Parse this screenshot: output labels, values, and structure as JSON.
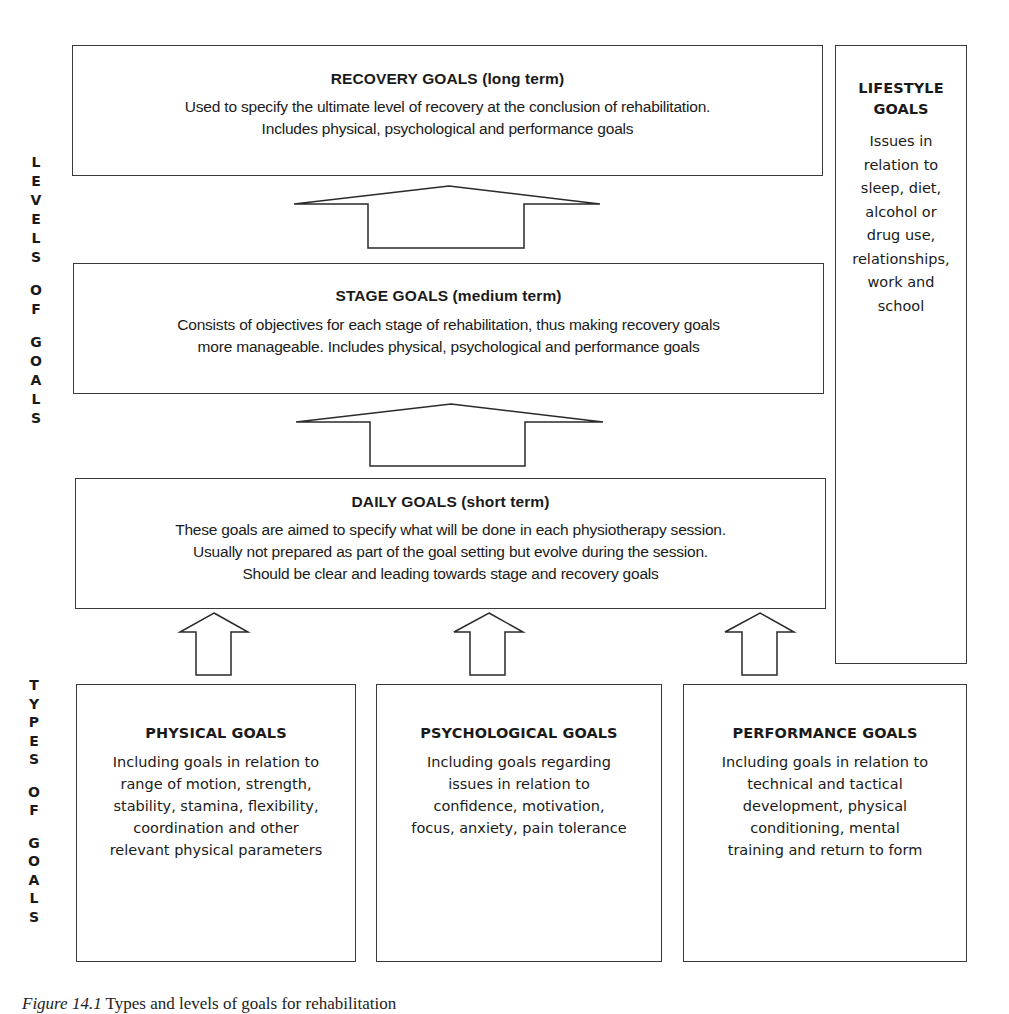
{
  "diagram": {
    "levels_label": [
      "L",
      "E",
      "V",
      "E",
      "L",
      "S",
      "",
      "O",
      "F",
      "",
      "G",
      "O",
      "A",
      "L",
      "S"
    ],
    "types_label": [
      "T",
      "Y",
      "P",
      "E",
      "S",
      "",
      "O",
      "F",
      "",
      "G",
      "O",
      "A",
      "L",
      "S"
    ],
    "levels": {
      "recovery": {
        "title": "RECOVERY GOALS (long term)",
        "lines": [
          "Used to specify the ultimate level of recovery at the conclusion of rehabilitation.",
          "Includes physical, psychological and performance goals"
        ]
      },
      "stage": {
        "title": "STAGE GOALS (medium term)",
        "lines": [
          "Consists of objectives for each stage of rehabilitation, thus making recovery goals",
          "more manageable. Includes physical, psychological and performance goals"
        ]
      },
      "daily": {
        "title": "DAILY GOALS (short term)",
        "lines": [
          "These goals are aimed to specify what will be done in each physiotherapy session.",
          "Usually not prepared as part of the goal setting but evolve during the session.",
          "Should be clear and leading towards stage and recovery goals"
        ]
      }
    },
    "lifestyle": {
      "title_lines": [
        "LIFESTYLE",
        "GOALS"
      ],
      "lines": [
        "Issues in",
        "relation to",
        "sleep, diet,",
        "alcohol or",
        "drug use,",
        "relationships,",
        "work and",
        "school"
      ]
    },
    "types": {
      "physical": {
        "title": "PHYSICAL GOALS",
        "lines": [
          "Including goals in relation to",
          "range of motion, strength,",
          "stability, stamina, flexibility,",
          "coordination and other",
          "relevant physical parameters"
        ]
      },
      "psychological": {
        "title": "PSYCHOLOGICAL GOALS",
        "lines": [
          "Including goals regarding",
          "issues in relation to",
          "confidence, motivation,",
          "focus, anxiety, pain tolerance"
        ]
      },
      "performance": {
        "title": "PERFORMANCE GOALS",
        "lines": [
          "Including goals in relation to",
          "technical and tactical",
          "development, physical",
          "conditioning, mental",
          "training and return to form"
        ]
      }
    },
    "arrows": [
      {
        "from": "stage",
        "to": "recovery"
      },
      {
        "from": "daily",
        "to": "stage"
      },
      {
        "from": "physical",
        "to": "daily"
      },
      {
        "from": "psychological",
        "to": "daily"
      },
      {
        "from": "performance",
        "to": "daily"
      }
    ]
  },
  "caption": {
    "figure": "Figure 14.1",
    "text": " Types and levels of goals for rehabilitation"
  }
}
